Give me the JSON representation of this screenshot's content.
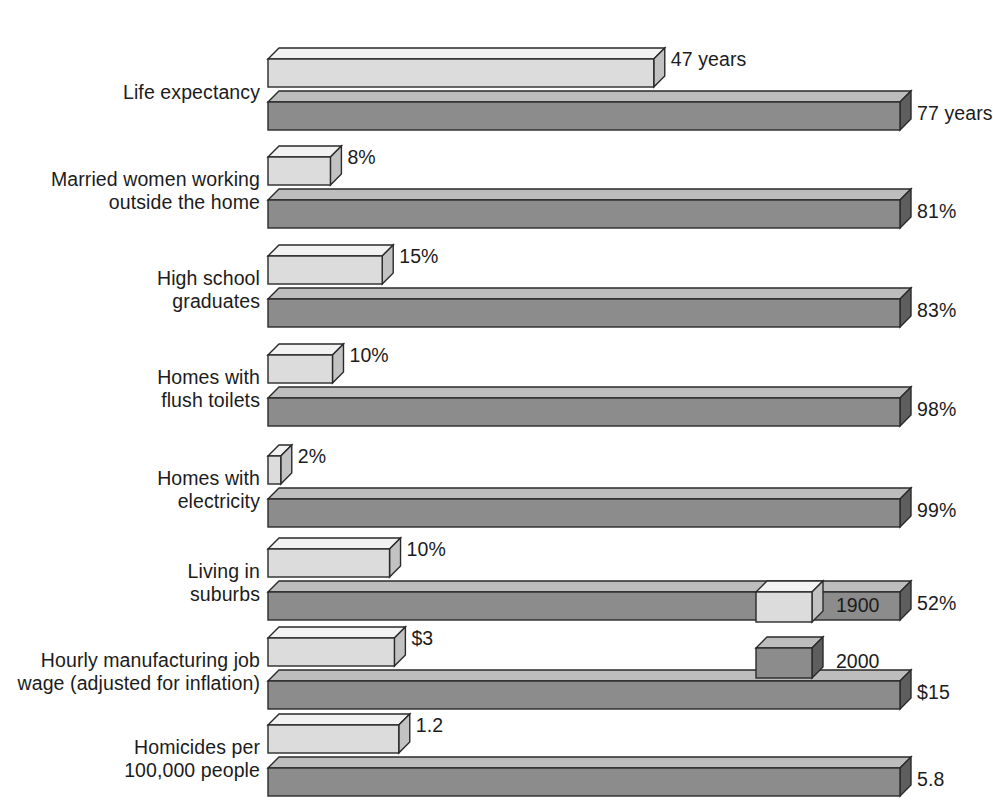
{
  "chart_data": {
    "type": "bar",
    "title": "",
    "subtitle": "",
    "xlabel": "",
    "ylabel": "",
    "orientation": "horizontal",
    "grid": false,
    "legend_position": "right-middle",
    "categories": [
      "Life expectancy",
      "Married women working\noutside the home",
      "High school\ngraduates",
      "Homes with\nflush toilets",
      "Homes with\nelectricity",
      "Living in\nsuburbs",
      "Hourly manufacturing job\nwage (adjusted for inflation)",
      "Homicides per\n100,000 people"
    ],
    "series": [
      {
        "name": "1900",
        "color": "#dcdcdc",
        "values": [
          47,
          8,
          15,
          10,
          2,
          10,
          3,
          1.2
        ],
        "labels": [
          "47 years",
          "8%",
          "15%",
          "10%",
          "2%",
          "10%",
          "$3",
          "1.2"
        ]
      },
      {
        "name": "2000",
        "color": "#8c8c8c",
        "values": [
          77,
          81,
          83,
          98,
          99,
          52,
          15,
          5.8
        ],
        "labels": [
          "77 years",
          "81%",
          "83%",
          "98%",
          "99%",
          "52%",
          "$15",
          "5.8"
        ]
      }
    ],
    "units": [
      "years",
      "percent",
      "percent",
      "percent",
      "percent",
      "percent",
      "dollars per hour",
      "rate per 100,000"
    ]
  },
  "legend": {
    "items": [
      {
        "label": "1900",
        "color": "#dcdcdc"
      },
      {
        "label": "2000",
        "color": "#8c8c8c"
      }
    ]
  },
  "colors": {
    "series_1900_top": "#f2f2f2",
    "series_1900_front": "#dcdcdc",
    "series_1900_side": "#c2c2c2",
    "series_2000_top": "#bdbdbd",
    "series_2000_front": "#8c8c8c",
    "series_2000_side": "#5e5e5e",
    "outline": "#2a2a2a",
    "text": "#1c1c1c",
    "background": "#ffffff"
  }
}
